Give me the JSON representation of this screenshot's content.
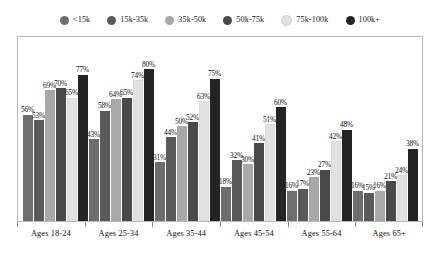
{
  "chart_data": {
    "type": "bar",
    "title": "",
    "subtitle": "",
    "xlabel": "",
    "ylabel": "",
    "ylim": [
      0,
      100
    ],
    "grid": false,
    "legend_position": "top",
    "value_suffix": "%",
    "categories": [
      "Ages 18-24",
      "Ages 25-34",
      "Ages 35-44",
      "Ages 45-54",
      "Ages 55-64",
      "Ages 65+"
    ],
    "series": [
      {
        "name": "<15k",
        "color": "#6e6e6e",
        "values": [
          56,
          43,
          31,
          18,
          16,
          16
        ]
      },
      {
        "name": "15k-35k",
        "color": "#5a5a5a",
        "values": [
          53,
          58,
          44,
          32,
          17,
          15
        ]
      },
      {
        "name": "35k-50k",
        "color": "#a8a8a8",
        "values": [
          69,
          64,
          50,
          30,
          23,
          16
        ]
      },
      {
        "name": "50k-75k",
        "color": "#4a4a4a",
        "values": [
          70,
          65,
          52,
          41,
          27,
          21
        ]
      },
      {
        "name": "75k-100k",
        "color": "#e2e2e2",
        "values": [
          65,
          74,
          63,
          51,
          42,
          24
        ]
      },
      {
        "name": "100k+",
        "color": "#242424",
        "values": [
          77,
          80,
          75,
          60,
          48,
          38
        ]
      }
    ],
    "labels": [
      [
        "56%",
        "53%",
        "69%",
        "70%",
        "65%",
        "77%"
      ],
      [
        "43%",
        "58%",
        "64%",
        "65%",
        "74%",
        "80%"
      ],
      [
        "31%",
        "44%",
        "50%",
        "52%",
        "63%",
        "75%"
      ],
      [
        "18%",
        "32%",
        "30%",
        "41%",
        "51%",
        "60%"
      ],
      [
        "16%",
        "17%",
        "23%",
        "27%",
        "42%",
        "48%"
      ],
      [
        "16%",
        "15%",
        "16%",
        "21%",
        "24%",
        "38%"
      ]
    ]
  },
  "legend": {
    "items": [
      {
        "label": "<15k",
        "color": "#6e6e6e"
      },
      {
        "label": "15k-35k",
        "color": "#5a5a5a"
      },
      {
        "label": "35k-50k",
        "color": "#a8a8a8"
      },
      {
        "label": "50k-75k",
        "color": "#4a4a4a"
      },
      {
        "label": "75k-100k",
        "color": "#e2e2e2"
      },
      {
        "label": "100k+",
        "color": "#242424"
      }
    ]
  },
  "axis": {
    "labels": [
      "Ages 18-24",
      "Ages 25-34",
      "Ages 35-44",
      "Ages 45-54",
      "Ages 55-64",
      "Ages 65+"
    ]
  }
}
